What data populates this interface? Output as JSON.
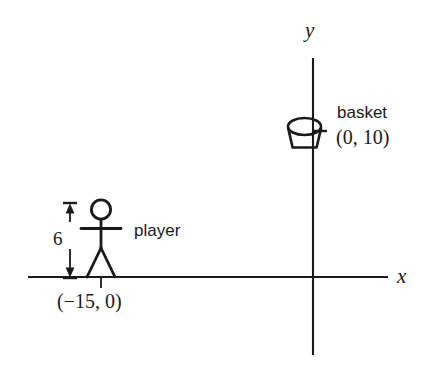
{
  "figure": {
    "type": "diagram",
    "background_color": "#ffffff",
    "ink_color": "#1a1a1a"
  },
  "axes": {
    "x_axis_label": "x",
    "y_axis_label": "y",
    "origin_px": {
      "x": 313,
      "y": 277
    },
    "x_axis_extent_px": {
      "x1": 28,
      "x2": 388,
      "y": 277
    },
    "y_axis_extent_px": {
      "x": 313,
      "y1": 58,
      "y2": 355
    },
    "tick_marks": [
      {
        "name": "player-x-tick",
        "x_px": 101,
        "y_px": 277
      },
      {
        "name": "basket-y-tick",
        "x_px": 313,
        "y_px": 131
      }
    ]
  },
  "annotations": {
    "player_label": "player",
    "player_coordinate": "(−15, 0)",
    "player_height_value": "6",
    "basket_label": "basket",
    "basket_coordinate": "(0, 10)"
  },
  "objects": [
    {
      "name": "player",
      "icon": "stick-figure-icon",
      "label": "player",
      "coordinate_text": "(−15, 0)",
      "coordinate": {
        "x": -15,
        "y": 0
      },
      "height_label": "6",
      "height": 6
    },
    {
      "name": "basket",
      "icon": "basket-icon",
      "label": "basket",
      "coordinate_text": "(0, 10)",
      "coordinate": {
        "x": 0,
        "y": 10
      }
    }
  ],
  "dimension": {
    "name": "player-height-dimension",
    "value_text": "6",
    "orientation": "vertical",
    "from_px": {
      "x": 70,
      "y": 203
    },
    "to_px": {
      "x": 70,
      "y": 278
    }
  }
}
